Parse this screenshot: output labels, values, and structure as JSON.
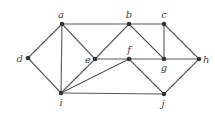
{
  "graph": {
    "colors": {
      "edge": "#5a5a5a",
      "node": "#333333",
      "label": "#444444",
      "background": "#ffffff"
    },
    "nodes": [
      {
        "id": "a",
        "label": "a",
        "x": 62,
        "y": 24,
        "lx": 61,
        "ly": 18,
        "anchor": "middle"
      },
      {
        "id": "b",
        "label": "b",
        "x": 129,
        "y": 24,
        "lx": 129,
        "ly": 18,
        "anchor": "middle"
      },
      {
        "id": "c",
        "label": "c",
        "x": 164,
        "y": 24,
        "lx": 164,
        "ly": 18,
        "anchor": "middle"
      },
      {
        "id": "d",
        "label": "d",
        "x": 28,
        "y": 58,
        "lx": 23,
        "ly": 62,
        "anchor": "end"
      },
      {
        "id": "e",
        "label": "e",
        "x": 95,
        "y": 59,
        "lx": 91,
        "ly": 63,
        "anchor": "end"
      },
      {
        "id": "f",
        "label": "f",
        "x": 129,
        "y": 59,
        "lx": 129,
        "ly": 53,
        "anchor": "middle"
      },
      {
        "id": "g",
        "label": "g",
        "x": 164,
        "y": 59,
        "lx": 164,
        "ly": 71,
        "anchor": "middle"
      },
      {
        "id": "h",
        "label": "h",
        "x": 199,
        "y": 59,
        "lx": 203,
        "ly": 63,
        "anchor": "start"
      },
      {
        "id": "i",
        "label": "i",
        "x": 61,
        "y": 93,
        "lx": 61,
        "ly": 106,
        "anchor": "middle"
      },
      {
        "id": "j",
        "label": "j",
        "x": 164,
        "y": 94,
        "lx": 163,
        "ly": 107,
        "anchor": "middle"
      }
    ],
    "edges": [
      [
        "a",
        "d"
      ],
      [
        "d",
        "i"
      ],
      [
        "a",
        "i"
      ],
      [
        "a",
        "e"
      ],
      [
        "a",
        "b"
      ],
      [
        "b",
        "c"
      ],
      [
        "b",
        "e"
      ],
      [
        "b",
        "g"
      ],
      [
        "c",
        "g"
      ],
      [
        "c",
        "h"
      ],
      [
        "e",
        "f"
      ],
      [
        "f",
        "g"
      ],
      [
        "g",
        "h"
      ],
      [
        "e",
        "i"
      ],
      [
        "f",
        "i"
      ],
      [
        "i",
        "j"
      ],
      [
        "f",
        "j"
      ],
      [
        "j",
        "h"
      ]
    ]
  }
}
